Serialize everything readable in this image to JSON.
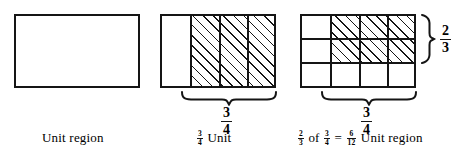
{
  "figures": {
    "unit": {
      "caption": "Unit region",
      "rows": 1,
      "cols": 1,
      "shaded_cells": 0,
      "total_cells": 1
    },
    "three_fourths": {
      "caption_fraction": {
        "numerator": "3",
        "denominator": "4"
      },
      "caption_suffix": "Unit",
      "brace_label": {
        "numerator": "3",
        "denominator": "4"
      },
      "rows": 1,
      "cols": 4,
      "shaded_cells": 3,
      "total_cells": 4
    },
    "product": {
      "rows": 3,
      "cols": 4,
      "shaded_cells": 6,
      "total_cells": 12,
      "brace_bottom_label": {
        "numerator": "3",
        "denominator": "4"
      },
      "brace_right_label": {
        "numerator": "2",
        "denominator": "3"
      },
      "equation": {
        "factor_a": {
          "numerator": "2",
          "denominator": "3"
        },
        "of_word": "of",
        "factor_b": {
          "numerator": "3",
          "denominator": "4"
        },
        "equals": "=",
        "product": {
          "numerator": "6",
          "denominator": "12"
        },
        "suffix": "Unit region"
      }
    }
  },
  "colors": {
    "ink": "#151515",
    "background": "#ffffff"
  }
}
